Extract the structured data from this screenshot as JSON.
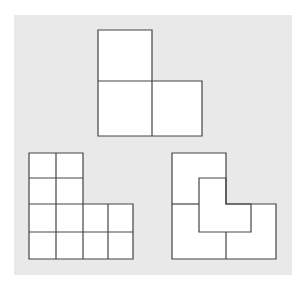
{
  "figure": {
    "background_color": "#e9e9e9",
    "fill_color": "#ffffff",
    "stroke_color": "#444444",
    "shapes": [
      {
        "name": "l-tromino-top",
        "cells": 3
      },
      {
        "name": "l-grid-bottom-left",
        "cells": 12
      },
      {
        "name": "l-rep-tile-bottom-right",
        "pieces": 4
      }
    ]
  }
}
